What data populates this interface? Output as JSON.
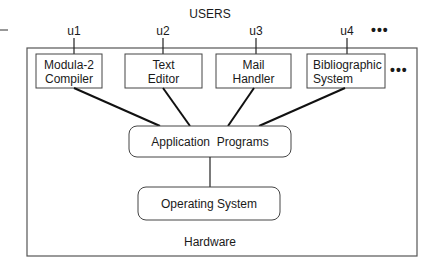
{
  "title": "USERS",
  "users": [
    "u1",
    "u2",
    "u3",
    "u4"
  ],
  "more_users": "•••",
  "modules": [
    {
      "line1": "Modula-2",
      "line2": "Compiler"
    },
    {
      "line1": "Text",
      "line2": "Editor"
    },
    {
      "line1": "Mail",
      "line2": "Handler"
    },
    {
      "line1": "Bibliographic",
      "line2": "System"
    }
  ],
  "more_modules": "•••",
  "application_layer": "Application  Programs",
  "os_layer": "Operating System",
  "hardware_layer": "Hardware"
}
